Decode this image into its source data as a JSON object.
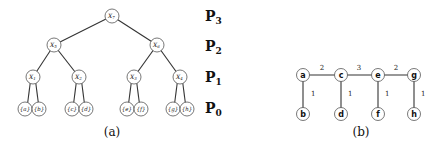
{
  "figure_a": {
    "caption": "(a)",
    "tree": {
      "root": "X7",
      "level2": [
        "X5",
        "X6"
      ],
      "level1": [
        "X1",
        "X2",
        "X3",
        "X4"
      ],
      "leaves": [
        "{a}",
        "{b}",
        "{c}",
        "{d}",
        "{e}",
        "{f}",
        "{g}",
        "{h}"
      ]
    },
    "node_labels": {
      "x7": "X",
      "x7_sub": "7",
      "x5": "X",
      "x5_sub": "5",
      "x6": "X",
      "x6_sub": "6",
      "x1": "X",
      "x1_sub": "1",
      "x2": "X",
      "x2_sub": "2",
      "x3": "X",
      "x3_sub": "3",
      "x4": "X",
      "x4_sub": "4",
      "leaf_a": "{a}",
      "leaf_b": "{b}",
      "leaf_c": "{c}",
      "leaf_d": "{d}",
      "leaf_e": "{e}",
      "leaf_f": "{f}",
      "leaf_g": "{g}",
      "leaf_h": "{h}"
    },
    "partitions": [
      {
        "base": "P",
        "sub": "3"
      },
      {
        "base": "P",
        "sub": "2"
      },
      {
        "base": "P",
        "sub": "1"
      },
      {
        "base": "P",
        "sub": "0"
      }
    ]
  },
  "figure_b": {
    "caption": "(b)",
    "nodes": {
      "a": "a",
      "b": "b",
      "c": "c",
      "d": "d",
      "e": "e",
      "f": "f",
      "g": "g",
      "h": "h"
    },
    "edges": [
      {
        "from": "a",
        "to": "c",
        "weight": "2"
      },
      {
        "from": "c",
        "to": "e",
        "weight": "3"
      },
      {
        "from": "e",
        "to": "g",
        "weight": "2"
      },
      {
        "from": "a",
        "to": "b",
        "weight": "1"
      },
      {
        "from": "c",
        "to": "d",
        "weight": "1"
      },
      {
        "from": "e",
        "to": "f",
        "weight": "1"
      },
      {
        "from": "g",
        "to": "h",
        "weight": "1"
      }
    ]
  }
}
